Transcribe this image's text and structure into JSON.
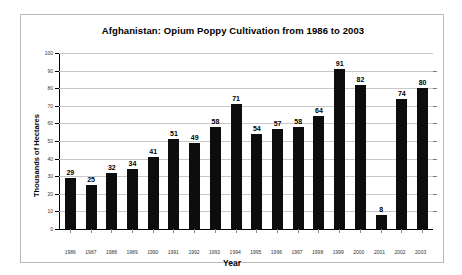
{
  "chart_data": {
    "type": "bar",
    "title": "Afghanistan: Opium Poppy Cultivation from 1986 to 2003",
    "xlabel": "Year",
    "ylabel": "Thousands of Hectares",
    "ylim": [
      0,
      100
    ],
    "ytick_step": 10,
    "yticks": [
      100,
      90,
      80,
      70,
      60,
      50,
      40,
      30,
      20,
      10,
      0
    ],
    "grid": true,
    "legend": false,
    "bar_color": "#0d0d0d",
    "categories": [
      "1986",
      "1987",
      "1988",
      "1989",
      "1990",
      "1991",
      "1992",
      "1993",
      "1994",
      "1995",
      "1996",
      "1997",
      "1998",
      "1999",
      "2000",
      "2001",
      "2002",
      "2003"
    ],
    "values": [
      29,
      25,
      32,
      34,
      41,
      51,
      49,
      58,
      71,
      54,
      57,
      58,
      64,
      91,
      82,
      8,
      74,
      80
    ],
    "data_labels": [
      "29",
      "25",
      "32",
      "34",
      "41",
      "51",
      "49",
      "58",
      "71",
      "54",
      "57",
      "58",
      "64",
      "91",
      "82",
      "8",
      "74",
      "80"
    ]
  }
}
